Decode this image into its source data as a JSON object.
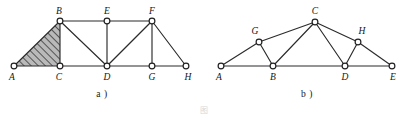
{
  "plate": {
    "caption": "图",
    "background_color": "#ffffff",
    "line_color": "#2b2b2b",
    "node_fill_color": "#ffffff",
    "hatch_color": "#3a3a3a",
    "hatch_fill_color": "#b9b9b9"
  },
  "figures": [
    {
      "id": "figure-a",
      "sub_caption": "a )",
      "type": "truss-diagram",
      "nodes": [
        {
          "label": "A",
          "x": 14,
          "y": 66,
          "label_x": 12,
          "label_y": 80
        },
        {
          "label": "B",
          "x": 60,
          "y": 21,
          "label_x": 59,
          "label_y": 14
        },
        {
          "label": "C",
          "x": 60,
          "y": 66,
          "label_x": 59,
          "label_y": 80
        },
        {
          "label": "D",
          "x": 107,
          "y": 66,
          "label_x": 107,
          "label_y": 80
        },
        {
          "label": "E",
          "x": 107,
          "y": 21,
          "label_x": 107,
          "label_y": 14
        },
        {
          "label": "F",
          "x": 152,
          "y": 21,
          "label_x": 152,
          "label_y": 14
        },
        {
          "label": "G",
          "x": 152,
          "y": 66,
          "label_x": 152,
          "label_y": 80
        },
        {
          "label": "H",
          "x": 186,
          "y": 66,
          "label_x": 188,
          "label_y": 80
        }
      ],
      "edges": [
        [
          "A",
          "B"
        ],
        [
          "A",
          "C"
        ],
        [
          "B",
          "C"
        ],
        [
          "B",
          "E"
        ],
        [
          "B",
          "D"
        ],
        [
          "C",
          "D"
        ],
        [
          "E",
          "F"
        ],
        [
          "E",
          "D"
        ],
        [
          "D",
          "F"
        ],
        [
          "D",
          "G"
        ],
        [
          "F",
          "G"
        ],
        [
          "F",
          "H"
        ],
        [
          "G",
          "H"
        ]
      ],
      "hatched_region": {
        "vertices": [
          "A",
          "B",
          "C"
        ]
      }
    },
    {
      "id": "figure-b",
      "sub_caption": "b )",
      "type": "truss-diagram",
      "nodes": [
        {
          "label": "A",
          "x": 16,
          "y": 66,
          "label_x": 14,
          "label_y": 80
        },
        {
          "label": "G",
          "x": 54,
          "y": 42,
          "label_x": 50,
          "label_y": 34
        },
        {
          "label": "B",
          "x": 68,
          "y": 66,
          "label_x": 68,
          "label_y": 80
        },
        {
          "label": "C",
          "x": 110,
          "y": 22,
          "label_x": 110,
          "label_y": 14
        },
        {
          "label": "D",
          "x": 140,
          "y": 66,
          "label_x": 140,
          "label_y": 80
        },
        {
          "label": "H",
          "x": 153,
          "y": 42,
          "label_x": 157,
          "label_y": 34
        },
        {
          "label": "E",
          "x": 187,
          "y": 66,
          "label_x": 188,
          "label_y": 80
        }
      ],
      "edges": [
        [
          "A",
          "G"
        ],
        [
          "A",
          "B"
        ],
        [
          "G",
          "C"
        ],
        [
          "G",
          "B"
        ],
        [
          "B",
          "C"
        ],
        [
          "B",
          "D"
        ],
        [
          "C",
          "D"
        ],
        [
          "C",
          "H"
        ],
        [
          "D",
          "H"
        ],
        [
          "D",
          "E"
        ],
        [
          "H",
          "E"
        ]
      ],
      "hatched_region": null
    }
  ]
}
